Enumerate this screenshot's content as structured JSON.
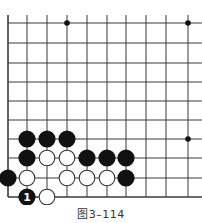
{
  "diagram": {
    "caption": "图3–114",
    "grid": {
      "cols_x": [
        8,
        27,
        47,
        67,
        87,
        107,
        126,
        146,
        166,
        188
      ],
      "rows_y": [
        23,
        43,
        63,
        82,
        101,
        120,
        139,
        158,
        178,
        197
      ],
      "right_extent": 202,
      "left_edge": true,
      "bottom_edge": true,
      "line_color": "#3a3a3a"
    },
    "star_points": [
      {
        "x": 67,
        "y": 23
      },
      {
        "x": 188,
        "y": 23
      },
      {
        "x": 188,
        "y": 139
      }
    ],
    "stones": [
      {
        "color": "black",
        "x": 27,
        "y": 139
      },
      {
        "color": "black",
        "x": 47,
        "y": 139
      },
      {
        "color": "black",
        "x": 67,
        "y": 139
      },
      {
        "color": "black",
        "x": 27,
        "y": 158
      },
      {
        "color": "white",
        "x": 47,
        "y": 158
      },
      {
        "color": "white",
        "x": 67,
        "y": 158
      },
      {
        "color": "black",
        "x": 87,
        "y": 158
      },
      {
        "color": "black",
        "x": 107,
        "y": 158
      },
      {
        "color": "black",
        "x": 126,
        "y": 158
      },
      {
        "color": "black",
        "x": 8,
        "y": 178
      },
      {
        "color": "white",
        "x": 27,
        "y": 178
      },
      {
        "color": "white",
        "x": 67,
        "y": 178
      },
      {
        "color": "white",
        "x": 87,
        "y": 178
      },
      {
        "color": "white",
        "x": 107,
        "y": 178
      },
      {
        "color": "black",
        "x": 126,
        "y": 178
      },
      {
        "color": "black",
        "x": 27,
        "y": 197,
        "label": "1"
      },
      {
        "color": "white",
        "x": 47,
        "y": 197
      }
    ],
    "colors": {
      "black_stone": "#111111",
      "white_stone_fill": "#ffffff",
      "white_stone_stroke": "#333333",
      "label_on_black": "#ffffff"
    }
  }
}
